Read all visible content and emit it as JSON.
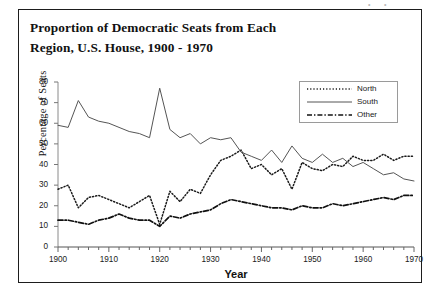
{
  "figure": {
    "title": "Proportion of Democratic Seats from Each\nRegion, U.S. House, 1900 - 1970",
    "background_color": "#ffffff",
    "frame_color": "#1d1d1d"
  },
  "axes": {
    "y_title": "Percentage of Seats",
    "x_title": "Year",
    "y_ticks": [
      "0",
      "10",
      "20",
      "30",
      "40",
      "50",
      "60",
      "70",
      "80"
    ],
    "x_ticks": [
      "1900",
      "1910",
      "1920",
      "1930",
      "1940",
      "1950",
      "1960",
      "1970"
    ]
  },
  "legend": {
    "entries": [
      {
        "label": "North",
        "style": "dotted",
        "color": "#1a1a1a"
      },
      {
        "label": "South",
        "style": "solid",
        "color": "#555555"
      },
      {
        "label": "Other",
        "style": "dash-dot",
        "color": "#101010"
      }
    ]
  },
  "chart_data": {
    "type": "line",
    "title": "Proportion of Democratic Seats from Each Region, U.S. House, 1900 - 1970",
    "xlabel": "Year",
    "ylabel": "Percentage of Seats",
    "xlim": [
      1900,
      1970
    ],
    "ylim": [
      0,
      80
    ],
    "grid": false,
    "legend_position": "upper-right",
    "x": [
      1900,
      1902,
      1904,
      1906,
      1908,
      1910,
      1912,
      1914,
      1916,
      1918,
      1920,
      1922,
      1924,
      1926,
      1928,
      1930,
      1932,
      1934,
      1936,
      1938,
      1940,
      1942,
      1944,
      1946,
      1948,
      1950,
      1952,
      1954,
      1956,
      1958,
      1960,
      1962,
      1964,
      1966,
      1968,
      1970
    ],
    "series": [
      {
        "name": "North",
        "style": "dotted",
        "color": "#1a1a1a",
        "values": [
          28,
          30,
          19,
          24,
          25,
          23,
          21,
          19,
          22,
          25,
          11,
          27,
          22,
          28,
          26,
          35,
          42,
          44,
          47,
          38,
          40,
          35,
          38,
          28,
          41,
          38,
          37,
          40,
          39,
          44,
          42,
          42,
          45,
          42,
          44,
          44
        ]
      },
      {
        "name": "South",
        "style": "solid",
        "color": "#555555",
        "values": [
          59,
          58,
          71,
          63,
          61,
          60,
          58,
          56,
          55,
          53,
          77,
          57,
          53,
          55,
          50,
          53,
          52,
          53,
          46,
          44,
          42,
          47,
          41,
          49,
          43,
          41,
          45,
          41,
          43,
          39,
          41,
          38,
          35,
          36,
          33,
          32
        ]
      },
      {
        "name": "Other",
        "style": "dash-dot",
        "color": "#101010",
        "values": [
          13,
          13,
          12,
          11,
          13,
          14,
          16,
          14,
          13,
          13,
          10,
          15,
          14,
          16,
          17,
          18,
          21,
          23,
          22,
          21,
          20,
          19,
          19,
          18,
          20,
          19,
          19,
          21,
          20,
          21,
          22,
          23,
          24,
          23,
          25,
          25
        ]
      }
    ]
  }
}
